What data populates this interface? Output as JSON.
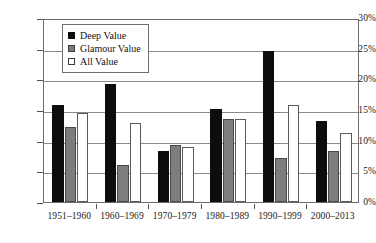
{
  "chart_data": {
    "type": "bar",
    "title": "",
    "xlabel": "",
    "ylabel": "",
    "ylim": [
      0,
      30
    ],
    "ytick_labels": [
      "0%",
      "5%",
      "10%",
      "15%",
      "20%",
      "25%",
      "30%"
    ],
    "ytick_values": [
      0,
      5,
      10,
      15,
      20,
      25,
      30
    ],
    "grid": true,
    "legend_position": "upper-left-inside",
    "categories": [
      "1951–1960",
      "1960–1969",
      "1970–1979",
      "1980–1989",
      "1990–1999",
      "2000–2013"
    ],
    "series": [
      {
        "name": "Deep Value",
        "color": "#0d0d0d",
        "values": [
          15.8,
          19.3,
          8.3,
          15.1,
          24.6,
          13.2
        ]
      },
      {
        "name": "Glamour Value",
        "color": "#7d7d7d",
        "values": [
          12.3,
          6.0,
          9.3,
          13.5,
          7.2,
          8.3
        ]
      },
      {
        "name": "All Value",
        "color": "#ffffff",
        "values": [
          14.5,
          12.9,
          9.0,
          13.5,
          15.8,
          11.3
        ]
      }
    ]
  },
  "legend": {
    "items": [
      {
        "label": "Deep Value",
        "swatch": "filled-black-square"
      },
      {
        "label": "Glamour Value",
        "swatch": "filled-gray-square"
      },
      {
        "label": "All Value",
        "swatch": "outlined-white-square"
      }
    ]
  }
}
